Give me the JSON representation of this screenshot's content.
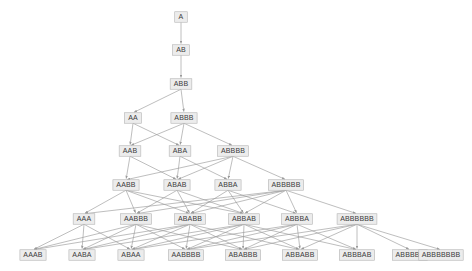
{
  "diagram": {
    "title": "",
    "type": "directed-acyclic-graph",
    "colors": {
      "background": "#ffffff",
      "node_fill": "#ececec",
      "node_border": "#b4b4b4",
      "node_text": "#3b3b3b",
      "edge": "#9a9a9a"
    },
    "levels": [
      {
        "index": 0,
        "y": 17,
        "nodes": [
          {
            "id": "A",
            "label": "A",
            "x": 181
          }
        ]
      },
      {
        "index": 1,
        "y": 50,
        "nodes": [
          {
            "id": "AB",
            "label": "AB",
            "x": 181
          }
        ]
      },
      {
        "index": 2,
        "y": 84,
        "nodes": [
          {
            "id": "ABB",
            "label": "ABB",
            "x": 181
          }
        ]
      },
      {
        "index": 3,
        "y": 118,
        "nodes": [
          {
            "id": "AA",
            "label": "AA",
            "x": 133
          },
          {
            "id": "ABBB",
            "label": "ABBB",
            "x": 184
          }
        ]
      },
      {
        "index": 4,
        "y": 151,
        "nodes": [
          {
            "id": "AAB",
            "label": "AAB",
            "x": 130
          },
          {
            "id": "ABA",
            "label": "ABA",
            "x": 180
          },
          {
            "id": "ABBBB",
            "label": "ABBBB",
            "x": 233
          }
        ]
      },
      {
        "index": 5,
        "y": 185,
        "nodes": [
          {
            "id": "AABB",
            "label": "AABB",
            "x": 126
          },
          {
            "id": "ABAB",
            "label": "ABAB",
            "x": 177
          },
          {
            "id": "ABBA",
            "label": "ABBA",
            "x": 228
          },
          {
            "id": "ABBBBB",
            "label": "ABBBBB",
            "x": 286
          }
        ]
      },
      {
        "index": 6,
        "y": 219,
        "nodes": [
          {
            "id": "AAA",
            "label": "AAA",
            "x": 84
          },
          {
            "id": "AABBB",
            "label": "AABBB",
            "x": 136
          },
          {
            "id": "ABABB",
            "label": "ABABB",
            "x": 190
          },
          {
            "id": "ABBAB",
            "label": "ABBAB",
            "x": 244
          },
          {
            "id": "ABBBA",
            "label": "ABBBA",
            "x": 297
          },
          {
            "id": "ABBBBBB",
            "label": "ABBBBBB",
            "x": 357
          }
        ]
      },
      {
        "index": 7,
        "y": 255,
        "nodes": [
          {
            "id": "AAAB",
            "label": "AAAB",
            "x": 33
          },
          {
            "id": "AABA",
            "label": "AABA",
            "x": 82
          },
          {
            "id": "ABAA",
            "label": "ABAA",
            "x": 131
          },
          {
            "id": "AABBBB",
            "label": "AABBBB",
            "x": 186
          },
          {
            "id": "ABABBB",
            "label": "ABABBB",
            "x": 243
          },
          {
            "id": "ABBABB",
            "label": "ABBABB",
            "x": 300
          },
          {
            "id": "ABBBAB",
            "label": "ABBBAB",
            "x": 357
          },
          {
            "id": "ABBBBA",
            "label": "ABBBBA",
            "x": 410
          },
          {
            "id": "ABBBBBBB",
            "label": "ABBBBBBB",
            "x": 441
          }
        ]
      }
    ],
    "edges": [
      [
        "A",
        "AB"
      ],
      [
        "AB",
        "ABB"
      ],
      [
        "ABB",
        "AA"
      ],
      [
        "ABB",
        "ABBB"
      ],
      [
        "AA",
        "AAB"
      ],
      [
        "AA",
        "ABA"
      ],
      [
        "ABBB",
        "AAB"
      ],
      [
        "ABBB",
        "ABA"
      ],
      [
        "ABBB",
        "ABBBB"
      ],
      [
        "AAB",
        "AABB"
      ],
      [
        "AAB",
        "ABAB"
      ],
      [
        "ABA",
        "ABAB"
      ],
      [
        "ABA",
        "ABBA"
      ],
      [
        "ABBBB",
        "AABB"
      ],
      [
        "ABBBB",
        "ABAB"
      ],
      [
        "ABBBB",
        "ABBA"
      ],
      [
        "ABBBB",
        "ABBBBB"
      ],
      [
        "AABB",
        "AAA"
      ],
      [
        "AABB",
        "AABBB"
      ],
      [
        "AABB",
        "ABABB"
      ],
      [
        "AABB",
        "ABBAB"
      ],
      [
        "ABAB",
        "AABBB"
      ],
      [
        "ABAB",
        "ABABB"
      ],
      [
        "ABAB",
        "ABBAB"
      ],
      [
        "ABBA",
        "ABABB"
      ],
      [
        "ABBA",
        "ABBAB"
      ],
      [
        "ABBA",
        "ABBBA"
      ],
      [
        "ABBBBB",
        "AAA"
      ],
      [
        "ABBBBB",
        "AABBB"
      ],
      [
        "ABBBBB",
        "ABABB"
      ],
      [
        "ABBBBB",
        "ABBAB"
      ],
      [
        "ABBBBB",
        "ABBBA"
      ],
      [
        "ABBBBB",
        "ABBBBBB"
      ],
      [
        "AAA",
        "AAAB"
      ],
      [
        "AAA",
        "AABA"
      ],
      [
        "AAA",
        "ABAA"
      ],
      [
        "AABBB",
        "AAAB"
      ],
      [
        "AABBB",
        "AABA"
      ],
      [
        "AABBB",
        "ABAA"
      ],
      [
        "AABBB",
        "AABBBB"
      ],
      [
        "AABBB",
        "ABABBB"
      ],
      [
        "ABABB",
        "AAAB"
      ],
      [
        "ABABB",
        "AABA"
      ],
      [
        "ABABB",
        "ABAA"
      ],
      [
        "ABABB",
        "AABBBB"
      ],
      [
        "ABABB",
        "ABABBB"
      ],
      [
        "ABABB",
        "ABBABB"
      ],
      [
        "ABBAB",
        "AABA"
      ],
      [
        "ABBAB",
        "ABAA"
      ],
      [
        "ABBAB",
        "AABBBB"
      ],
      [
        "ABBAB",
        "ABABBB"
      ],
      [
        "ABBAB",
        "ABBABB"
      ],
      [
        "ABBAB",
        "ABBBAB"
      ],
      [
        "ABBBA",
        "ABAA"
      ],
      [
        "ABBBA",
        "AABBBB"
      ],
      [
        "ABBBA",
        "ABABBB"
      ],
      [
        "ABBBA",
        "ABBABB"
      ],
      [
        "ABBBA",
        "ABBBAB"
      ],
      [
        "ABBBBBB",
        "AABBBB"
      ],
      [
        "ABBBBBB",
        "ABABBB"
      ],
      [
        "ABBBBBB",
        "ABBABB"
      ],
      [
        "ABBBBBB",
        "ABBBAB"
      ],
      [
        "ABBBBBB",
        "ABBBBA"
      ],
      [
        "ABBBBBB",
        "ABBBBBBB"
      ]
    ]
  }
}
